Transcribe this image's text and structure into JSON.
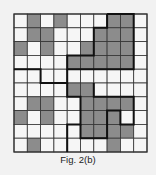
{
  "figure": {
    "caption": "Fig. 2(b)",
    "grid": {
      "rows": 10,
      "cols": 10,
      "origin": [
        14,
        14
      ],
      "cell_w": 13.3,
      "cell_h": 13.8,
      "shaded_color": "#8c8c8c",
      "empty_color": "#f6f6f6",
      "line_color": "#333333",
      "shaded": [
        [
          0,
          1
        ],
        [
          0,
          3
        ],
        [
          0,
          7
        ],
        [
          0,
          8
        ],
        [
          1,
          1
        ],
        [
          1,
          2
        ],
        [
          1,
          6
        ],
        [
          1,
          7
        ],
        [
          1,
          8
        ],
        [
          2,
          0
        ],
        [
          2,
          2
        ],
        [
          2,
          5
        ],
        [
          2,
          6
        ],
        [
          2,
          7
        ],
        [
          2,
          8
        ],
        [
          3,
          4
        ],
        [
          3,
          5
        ],
        [
          3,
          6
        ],
        [
          3,
          7
        ],
        [
          3,
          8
        ],
        [
          5,
          4
        ],
        [
          5,
          5
        ],
        [
          6,
          1
        ],
        [
          6,
          2
        ],
        [
          6,
          5
        ],
        [
          6,
          6
        ],
        [
          6,
          7
        ],
        [
          6,
          8
        ],
        [
          7,
          0
        ],
        [
          7,
          2
        ],
        [
          7,
          5
        ],
        [
          7,
          6
        ],
        [
          7,
          7
        ],
        [
          8,
          5
        ],
        [
          8,
          6
        ],
        [
          8,
          7
        ],
        [
          8,
          8
        ],
        [
          9,
          1
        ],
        [
          9,
          7
        ]
      ],
      "thick_paths": [
        [
          [
            7,
            0
          ],
          [
            9,
            0
          ],
          [
            9,
            4
          ],
          [
            4,
            4
          ],
          [
            4,
            3
          ],
          [
            6,
            3
          ],
          [
            6,
            1
          ],
          [
            7,
            1
          ],
          [
            7,
            0
          ]
        ],
        [
          [
            0,
            4
          ],
          [
            2,
            4
          ],
          [
            2,
            5
          ],
          [
            4,
            5
          ],
          [
            4,
            4
          ]
        ],
        [
          [
            4,
            5
          ],
          [
            4,
            6
          ],
          [
            5,
            6
          ],
          [
            5,
            8
          ],
          [
            4,
            8
          ],
          [
            4,
            10
          ]
        ],
        [
          [
            6,
            5
          ],
          [
            6,
            6
          ],
          [
            9,
            6
          ],
          [
            9,
            8
          ],
          [
            8,
            8
          ],
          [
            8,
            7
          ],
          [
            7,
            7
          ],
          [
            7,
            9
          ],
          [
            5,
            9
          ],
          [
            5,
            8
          ]
        ]
      ]
    }
  }
}
